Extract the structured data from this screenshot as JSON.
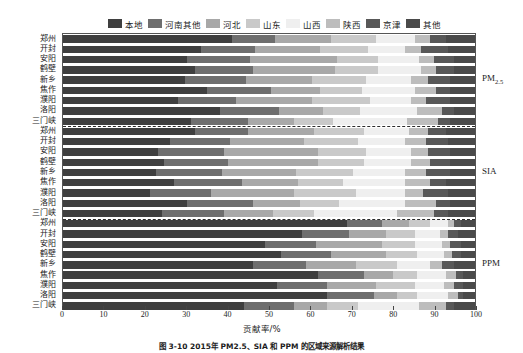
{
  "chart_data": {
    "type": "bar",
    "orientation": "horizontal",
    "stacked": true,
    "title": "",
    "xlabel": "贡献率/%",
    "ylabel": "",
    "xlim": [
      0,
      100
    ],
    "xticks": [
      0,
      10,
      20,
      30,
      40,
      50,
      60,
      70,
      80,
      90,
      100
    ],
    "grid": false,
    "legend_position": "top",
    "series": [
      {
        "name": "本地",
        "color": "#3f3f3f"
      },
      {
        "name": "河南其他",
        "color": "#6e6e6e"
      },
      {
        "name": "河北",
        "color": "#a8a8a8"
      },
      {
        "name": "山东",
        "color": "#c9c9c9"
      },
      {
        "name": "山西",
        "color": "#efefef"
      },
      {
        "name": "陕西",
        "color": "#bdbdbd"
      },
      {
        "name": "京津",
        "color": "#585858"
      },
      {
        "name": "其他",
        "color": "#4a4a4a"
      }
    ],
    "groups": [
      {
        "name": "PM2.5",
        "label_html": "PM<sub>2.5</sub>",
        "categories": [
          "郑州",
          "开封",
          "安阳",
          "鹤壁",
          "新乡",
          "焦作",
          "濮阳",
          "洛阳",
          "三门峡"
        ],
        "values": [
          [
            41.0,
            10.5,
            13.5,
            11.0,
            9.5,
            3.5,
            4.0,
            7.0
          ],
          [
            33.5,
            13.0,
            16.0,
            11.5,
            9.0,
            4.0,
            6.5,
            6.5
          ],
          [
            30.0,
            15.5,
            21.0,
            10.0,
            10.0,
            3.5,
            5.0,
            5.0
          ],
          [
            32.0,
            14.0,
            20.0,
            10.5,
            10.5,
            3.5,
            4.5,
            5.0
          ],
          [
            29.5,
            15.0,
            16.0,
            13.0,
            11.0,
            4.0,
            5.5,
            6.0
          ],
          [
            35.0,
            15.5,
            12.0,
            10.0,
            13.0,
            5.0,
            3.5,
            6.0
          ],
          [
            28.0,
            14.0,
            18.5,
            14.0,
            10.0,
            3.5,
            6.0,
            6.0
          ],
          [
            38.0,
            14.5,
            10.5,
            9.0,
            14.0,
            6.0,
            3.0,
            5.0
          ],
          [
            31.0,
            14.0,
            11.0,
            9.5,
            18.0,
            7.5,
            3.0,
            6.0
          ]
        ]
      },
      {
        "name": "SIA",
        "label_html": "SIA",
        "categories": [
          "郑州",
          "开封",
          "安阳",
          "鹤壁",
          "新乡",
          "焦作",
          "濮阳",
          "洛阳",
          "三门峡"
        ],
        "values": [
          [
            32.0,
            13.0,
            16.0,
            12.0,
            11.0,
            4.5,
            4.5,
            7.0
          ],
          [
            26.0,
            14.5,
            18.0,
            13.0,
            11.5,
            5.0,
            5.5,
            6.5
          ],
          [
            23.0,
            16.0,
            23.0,
            11.5,
            11.0,
            4.0,
            5.5,
            6.0
          ],
          [
            24.5,
            15.5,
            22.0,
            11.0,
            11.5,
            4.5,
            5.0,
            6.0
          ],
          [
            22.5,
            16.0,
            18.0,
            14.0,
            12.5,
            5.0,
            6.0,
            6.0
          ],
          [
            27.0,
            16.5,
            13.5,
            11.0,
            15.0,
            6.0,
            4.0,
            7.0
          ],
          [
            21.0,
            15.0,
            20.0,
            15.0,
            12.0,
            4.5,
            6.0,
            6.5
          ],
          [
            30.0,
            16.0,
            11.5,
            9.5,
            16.0,
            7.5,
            3.5,
            6.0
          ],
          [
            24.0,
            15.0,
            12.0,
            10.0,
            20.0,
            9.0,
            3.5,
            6.5
          ]
        ]
      },
      {
        "name": "PPM",
        "label_html": "PPM",
        "categories": [
          "郑州",
          "开封",
          "安阳",
          "鹤壁",
          "新乡",
          "焦作",
          "濮阳",
          "洛阳",
          "三门峡"
        ],
        "values": [
          [
            69.0,
            8.5,
            6.5,
            5.0,
            4.5,
            1.5,
            1.5,
            3.5
          ],
          [
            58.0,
            11.5,
            9.0,
            7.0,
            6.0,
            2.0,
            2.5,
            4.0
          ],
          [
            49.0,
            12.5,
            16.0,
            8.0,
            6.5,
            2.0,
            2.5,
            3.5
          ],
          [
            53.0,
            12.0,
            13.5,
            7.5,
            6.5,
            2.0,
            2.0,
            3.5
          ],
          [
            46.0,
            13.0,
            12.0,
            10.0,
            8.0,
            3.0,
            3.0,
            5.0
          ],
          [
            62.0,
            11.0,
            7.0,
            6.0,
            7.0,
            2.5,
            1.5,
            3.0
          ],
          [
            52.0,
            12.0,
            12.0,
            9.5,
            7.0,
            2.5,
            2.0,
            3.0
          ],
          [
            64.0,
            11.5,
            5.5,
            5.0,
            7.5,
            2.5,
            1.0,
            3.0
          ],
          [
            44.0,
            12.0,
            8.0,
            7.5,
            15.0,
            6.5,
            2.0,
            5.0
          ]
        ]
      }
    ]
  },
  "caption": "图 3-10  2015年 PM2.5、SIA 和 PPM 的区域来源解析结果",
  "axis": {
    "x_title": "贡献率/%"
  }
}
